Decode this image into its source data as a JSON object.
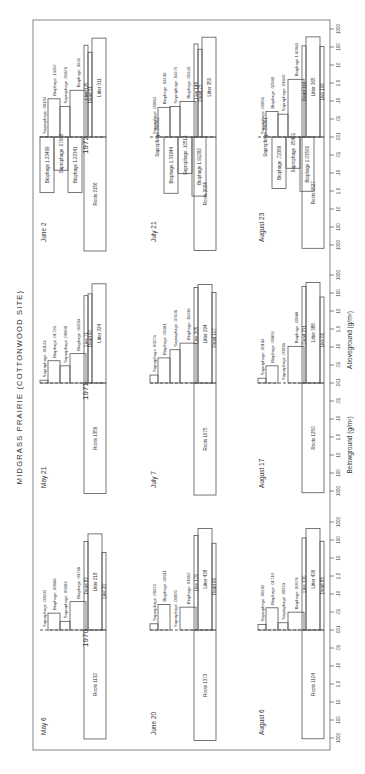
{
  "title": "MIDGRASS PRAIRIE (COTTONWOOD SITE)",
  "chart_data": {
    "type": "bar",
    "title": "MIDGRASS PRAIRIE (COTTONWOOD SITE)",
    "orientation": "rotated 90 degrees counter-clockwise",
    "scale": "log",
    "axis_ticks": [
      "1000",
      "100",
      "10",
      "1.0",
      ".10",
      ".01",
      ".001",
      ".01",
      ".10",
      "1.0",
      "10",
      "100",
      "1000"
    ],
    "aboveground_label": "Aboveground (g/m²)",
    "belowground_label": "Belowground (g/m²)",
    "range_g_per_m2": [
      0.001,
      1000
    ],
    "years": [
      {
        "year": "1970",
        "dates": [
          {
            "date": "May 6",
            "aboveground": [
              {
                "name": "Saprophage",
                "value": ".00100"
              },
              {
                "name": "Biophage",
                "value": ".00866"
              },
              {
                "name": "Saprophage",
                "value": ".00303"
              },
              {
                "name": "Biophage",
                "value": ".03766"
              },
              {
                "name": "Dead",
                "value": "82"
              },
              {
                "name": "Litter",
                "value": "218"
              },
              {
                "name": "Live",
                "value": "20"
              }
            ],
            "belowground": [
              {
                "name": "Roots",
                "value": "1132"
              }
            ]
          },
          {
            "date": "June 20",
            "aboveground": [
              {
                "name": "Saprophage",
                "value": ".00221"
              },
              {
                "name": "Biophage",
                "value": ".02611"
              },
              {
                "name": "Saprophage",
                "value": ".00095"
              },
              {
                "name": "Biophage",
                "value": ".01859"
              },
              {
                "name": "Live",
                "value": "179"
              },
              {
                "name": "Litter",
                "value": "438"
              },
              {
                "name": "Dead",
                "value": "66"
              }
            ],
            "belowground": [
              {
                "name": "Roots",
                "value": "1373"
              }
            ]
          },
          {
            "date": "August 6",
            "aboveground": [
              {
                "name": "Saprophage",
                "value": ".00202"
              },
              {
                "name": "Biophage",
                "value": ".01710"
              },
              {
                "name": "Saprophage",
                "value": ".00253"
              },
              {
                "name": "Biophage",
                "value": ".00978"
              },
              {
                "name": "Live",
                "value": "130"
              },
              {
                "name": "Litter",
                "value": "439"
              },
              {
                "name": "Dead",
                "value": "85"
              }
            ],
            "belowground": [
              {
                "name": "Roots",
                "value": "1104"
              }
            ]
          }
        ]
      },
      {
        "year": "1971",
        "dates": [
          {
            "date": "May 21",
            "aboveground": [
              {
                "name": "Saprophage",
                "value": ".00143"
              },
              {
                "name": "Biophage",
                "value": ".01726"
              },
              {
                "name": "Saprophage",
                "value": ".00900"
              },
              {
                "name": "Biophage",
                "value": ".04283"
              },
              {
                "name": "Live",
                "value": "71"
              },
              {
                "name": "Dead",
                "value": "90"
              },
              {
                "name": "Litter",
                "value": "324"
              }
            ],
            "belowground": [
              {
                "name": "Roots",
                "value": "1359"
              }
            ]
          },
          {
            "date": "July 7",
            "aboveground": [
              {
                "name": "Saprophage",
                "value": ".00276"
              },
              {
                "name": "Biophage",
                "value": ".02481"
              },
              {
                "name": "Saprophage",
                "value": ".07046"
              },
              {
                "name": "Biophage",
                "value": ".16436"
              },
              {
                "name": "Live",
                "value": "205"
              },
              {
                "name": "Litter",
                "value": "294"
              },
              {
                "name": "Dead",
                "value": "107"
              }
            ],
            "belowground": [
              {
                "name": "Roots",
                "value": "1675"
              }
            ]
          },
          {
            "date": "August 17",
            "aboveground": [
              {
                "name": "Saprophage",
                "value": ".00184"
              },
              {
                "name": "Biophage",
                "value": ".00899"
              },
              {
                "name": "Saprophage",
                "value": ".00038"
              },
              {
                "name": "Biophage",
                "value": ".10888"
              },
              {
                "name": "Dead",
                "value": "231"
              },
              {
                "name": "Litter",
                "value": "388"
              },
              {
                "name": "Live",
                "value": "60"
              }
            ],
            "belowground": [
              {
                "name": "Roots",
                "value": "1250"
              }
            ]
          }
        ]
      },
      {
        "year": "1972",
        "dates": [
          {
            "date": "June 2",
            "aboveground": [
              {
                "name": "Saprophage",
                "value": ".00104"
              },
              {
                "name": "Biophage",
                "value": ".13267"
              },
              {
                "name": "Saprophage",
                "value": ".04876"
              },
              {
                "name": "Biophage",
                "value": ".3941"
              },
              {
                "name": "Live",
                "value": "125"
              },
              {
                "name": "Dead",
                "value": "51"
              },
              {
                "name": "Litter",
                "value": "311"
              }
            ],
            "belowground": [
              {
                "name": "Biophage",
                "value": "1.23499"
              },
              {
                "name": "Saprophage",
                "value": ".07000"
              },
              {
                "name": "Biophage",
                "value": "1.22341"
              },
              {
                "name": "Roots",
                "value": "2156"
              }
            ]
          },
          {
            "date": "July 21",
            "aboveground": [
              {
                "name": "Saprophage",
                "value": ".00060"
              },
              {
                "name": "Biophage",
                "value": ".04430"
              },
              {
                "name": "Saprophage",
                "value": ".04979"
              },
              {
                "name": "Biophage",
                "value": ".09446"
              },
              {
                "name": "Live",
                "value": "148"
              },
              {
                "name": "Dead",
                "value": "75"
              },
              {
                "name": "Litter",
                "value": "350"
              }
            ],
            "belowground": [
              {
                "name": "Saprophage",
                "value": ".00002"
              },
              {
                "name": "Biophage",
                "value": "1.33944"
              },
              {
                "name": "Saprophage",
                "value": ".10513"
              },
              {
                "name": "Biophage",
                "value": "1.91292"
              },
              {
                "name": "Roots",
                "value": "2004"
              }
            ]
          },
          {
            "date": "August 23",
            "aboveground": [
              {
                "name": "Saprophage",
                "value": ".00056"
              },
              {
                "name": "Biophage",
                "value": ".02580"
              },
              {
                "name": "Saprophage",
                "value": ".01849"
              },
              {
                "name": "Biophage",
                "value": "1.60044"
              },
              {
                "name": "Dead",
                "value": "116"
              },
              {
                "name": "Litter",
                "value": "365"
              },
              {
                "name": "Live",
                "value": "106"
              }
            ],
            "belowground": [
              {
                "name": "Saprophage",
                "value": ".00001"
              },
              {
                "name": "Biophage",
                "value": ".72389"
              },
              {
                "name": "Saprophage",
                "value": ".05451"
              },
              {
                "name": "Biophage",
                "value": "1.03560"
              },
              {
                "name": "Roots",
                "value": "1527"
              }
            ]
          }
        ]
      }
    ]
  }
}
